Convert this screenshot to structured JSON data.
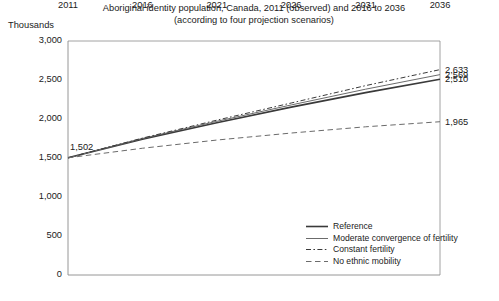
{
  "chart_data": {
    "type": "line",
    "title": "Aboriginal identity population, Canada, 2011 (observed) and 2016 to 2036",
    "subtitle": "(according to four projection scenarios)",
    "ylabel": "Thousands",
    "xlabel": "",
    "ylim": [
      0,
      3000
    ],
    "xlim": [
      2011,
      2036
    ],
    "grid": false,
    "legend_position": "inside-bottom-right",
    "yticks": [
      "0",
      "500",
      "1,000",
      "1,500",
      "2,000",
      "2,500",
      "3,000"
    ],
    "ytick_values": [
      0,
      500,
      1000,
      1500,
      2000,
      2500,
      3000
    ],
    "xticks": [
      "2011",
      "2016",
      "2021",
      "2026",
      "2031",
      "2036"
    ],
    "xtick_values": [
      2011,
      2016,
      2021,
      2026,
      2031,
      2036
    ],
    "x": [
      2011,
      2016,
      2021,
      2026,
      2031,
      2036
    ],
    "series": [
      {
        "name": "Reference",
        "style": "solid-thick",
        "color": "#3a3a3a",
        "values": [
          1502,
          1742,
          1952,
          2152,
          2338,
          2510
        ],
        "end_label": "2,510"
      },
      {
        "name": "Moderate convergence of fertility",
        "style": "solid-thin",
        "color": "#6b6b6b",
        "values": [
          1502,
          1750,
          1970,
          2180,
          2382,
          2569
        ],
        "end_label": "2,569"
      },
      {
        "name": "Constant fertility",
        "style": "dash-dot",
        "color": "#3a3a3a",
        "values": [
          1502,
          1755,
          1985,
          2205,
          2428,
          2633
        ],
        "end_label": "2,633"
      },
      {
        "name": "No ethnic mobility",
        "style": "dashed",
        "color": "#6b6b6b",
        "values": [
          1502,
          1625,
          1730,
          1820,
          1900,
          1965
        ],
        "end_label": "1,965"
      }
    ],
    "annotations": [
      {
        "text": "1,502",
        "x": 2011,
        "y": 1502,
        "position": "above-right"
      },
      {
        "text": "2,633",
        "x": 2036,
        "y": 2633,
        "position": "right"
      },
      {
        "text": "2,569",
        "x": 2036,
        "y": 2569,
        "position": "right"
      },
      {
        "text": "2,510",
        "x": 2036,
        "y": 2510,
        "position": "right"
      },
      {
        "text": "1,965",
        "x": 2036,
        "y": 1965,
        "position": "right"
      }
    ]
  }
}
